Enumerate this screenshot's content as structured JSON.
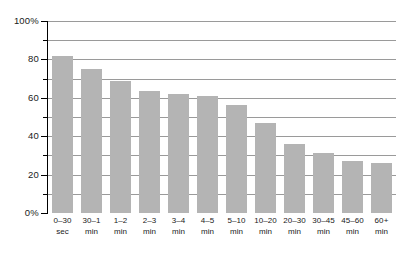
{
  "chart_data": {
    "type": "bar",
    "title": "",
    "subtitle": "",
    "xlabel": "",
    "ylabel": "",
    "ylim": [
      0,
      100
    ],
    "ytick_labels": [
      "0%",
      "20",
      "40",
      "60",
      "80",
      "100%"
    ],
    "ytick_values": [
      0,
      20,
      40,
      60,
      80,
      100
    ],
    "yminor_values": [
      10,
      30,
      50,
      70,
      90
    ],
    "gridlines": [
      "10",
      "20",
      "30",
      "40",
      "50",
      "60",
      "70",
      "80",
      "90",
      "100"
    ],
    "grid": true,
    "legend": "none",
    "bar_color": "#b4b4b4",
    "gridline_color": "#9a9a9a",
    "axis_color": "#000000",
    "background_color": "#ffffff",
    "categories": [
      "0–30 sec",
      "30–1 min",
      "1–2 min",
      "2–3 min",
      "3–4 min",
      "4–5 min",
      "5–10 min",
      "10–20 min",
      "20–30 min",
      "30–45 min",
      "45–60 min",
      "60+ min"
    ],
    "category_lines": [
      [
        "0–30",
        "sec"
      ],
      [
        "30–1",
        "min"
      ],
      [
        "1–2",
        "min"
      ],
      [
        "2–3",
        "min"
      ],
      [
        "3–4",
        "min"
      ],
      [
        "4–5",
        "min"
      ],
      [
        "5–10",
        "min"
      ],
      [
        "10–20",
        "min"
      ],
      [
        "20–30",
        "min"
      ],
      [
        "30–45",
        "min"
      ],
      [
        "45–60",
        "min"
      ],
      [
        "60+",
        "min"
      ]
    ],
    "values": [
      82,
      75,
      69,
      63.5,
      62,
      61,
      56,
      47,
      36,
      31,
      27,
      26
    ]
  }
}
